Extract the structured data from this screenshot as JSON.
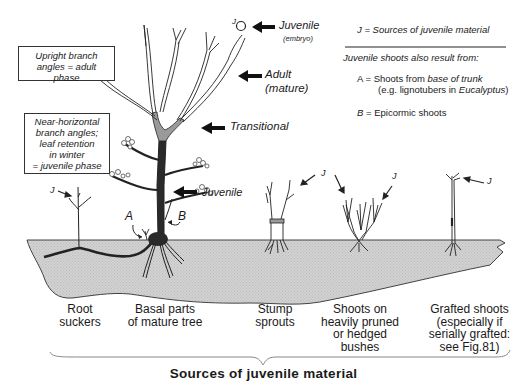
{
  "figure": {
    "title": "Sources of juvenile material",
    "boxes": {
      "adult_phase": {
        "lines": [
          "Upright branch",
          "angles = adult phase"
        ]
      },
      "juvenile_phase": {
        "lines": [
          "Near-horizontal",
          "branch angles;",
          "leaf retention",
          "in winter",
          "= juvenile phase"
        ]
      }
    },
    "tree_labels": {
      "juvenile_top": "Juvenile",
      "juvenile_top_sub": "(embryo)",
      "adult": "Adult",
      "adult_sub": "(mature)",
      "transitional": "Transitional",
      "juvenile_trunk": "Juvenile",
      "j_marker": "J",
      "a_marker": "A",
      "b_marker": "B"
    },
    "legend": {
      "j_def": "J = Sources of juvenile material",
      "also_heading": "Juvenile shoots also result from:",
      "a_line1_prefix": "A = Shoots from ",
      "a_line1_italic": "base of trunk",
      "a_line2_prefix": "(e.g. lignotubers in ",
      "a_line2_italic": "Eucalyptus",
      "a_line2_suffix": ")",
      "b_line": "B = Epicormic shoots",
      "b_letter": "B",
      "b_rest": " = Epicormic shoots"
    },
    "captions": [
      {
        "id": "root-suckers",
        "lines": [
          "Root",
          "suckers"
        ]
      },
      {
        "id": "basal-parts",
        "lines": [
          "Basal parts",
          "of mature tree"
        ]
      },
      {
        "id": "stump-sprouts",
        "lines": [
          "Stump",
          "sprouts"
        ]
      },
      {
        "id": "pruned-bushes",
        "lines": [
          "Shoots on",
          "heavily pruned",
          "or hedged",
          "bushes"
        ]
      },
      {
        "id": "grafted-shoots",
        "lines": [
          "Grafted shoots",
          "(especially if",
          "serially grafted:",
          "see Fig.81)"
        ]
      }
    ],
    "colors": {
      "ground_fill": "#d4d4d4",
      "juvenile_trunk": "#2a2a2a",
      "transitional_zone": "#9a9a9a",
      "line": "#222222"
    },
    "icons": [
      "arrow-left-icon",
      "embryo-circle-icon",
      "curved-arrow-icon"
    ]
  }
}
